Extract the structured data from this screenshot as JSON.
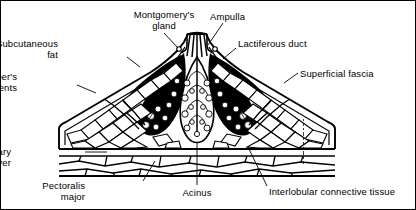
{
  "figure": {
    "type": "anatomical-line-diagram",
    "width": 416,
    "height": 210,
    "ink_color": "#000000",
    "background_color": "#ffffff",
    "border_color": "#000000"
  },
  "labels": [
    {
      "id": "montgomerys-gland",
      "text": "Montgomery's\ngland",
      "align": "center",
      "x": 163,
      "y": 8,
      "leader": [
        [
          163,
          32
        ],
        [
          177,
          47
        ]
      ]
    },
    {
      "id": "ampulla",
      "text": "Ampulla",
      "align": "left",
      "x": 209,
      "y": 10,
      "leader": [
        [
          222,
          22
        ],
        [
          207,
          44
        ]
      ]
    },
    {
      "id": "subcutaneous-fat",
      "text": "Subcutaneous\nfat",
      "align": "right",
      "x": 59,
      "y": 37,
      "leader": [
        [
          126,
          56
        ],
        [
          139,
          66
        ]
      ]
    },
    {
      "id": "lactiferous-duct",
      "text": "Lactiferous duct",
      "align": "left",
      "x": 237,
      "y": 37,
      "leader": [
        [
          235,
          47
        ],
        [
          222,
          58
        ]
      ]
    },
    {
      "id": "coopers-ligaments",
      "text": "Cooper's\nligaments",
      "align": "right",
      "x": 18,
      "y": 70,
      "leader": [
        [
          76,
          84
        ],
        [
          95,
          92
        ]
      ]
    },
    {
      "id": "superficial-fascia",
      "text": "Superficial fascia",
      "align": "left",
      "x": 299,
      "y": 67,
      "leader": [
        [
          297,
          72
        ],
        [
          283,
          82
        ]
      ]
    },
    {
      "id": "retromammary-layer",
      "text": "Retromammary\nlayer",
      "align": "right",
      "x": 12,
      "y": 145,
      "leader": [
        [
          84,
          151
        ],
        [
          106,
          151
        ]
      ]
    },
    {
      "id": "pectoralis-major",
      "text": "Pectoralis\nmajor",
      "align": "right",
      "x": 86,
      "y": 179,
      "leader": [
        [
          142,
          180
        ],
        [
          154,
          160
        ]
      ]
    },
    {
      "id": "acinus",
      "text": "Acinus",
      "align": "center",
      "x": 196,
      "y": 186,
      "leader": [
        [
          196,
          184
        ],
        [
          196,
          141
        ]
      ]
    },
    {
      "id": "interlobular-connective-tissue",
      "text": "Interlobular connective tissue",
      "align": "left",
      "x": 268,
      "y": 185,
      "leader": [
        [
          266,
          185
        ],
        [
          247,
          146
        ]
      ]
    }
  ],
  "artist_signature": {
    "present": true,
    "orientation": "vertical",
    "legible": false,
    "x": 303,
    "y": 118
  }
}
